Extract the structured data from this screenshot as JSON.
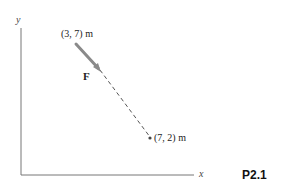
{
  "diagram": {
    "axes": {
      "x_label": "x",
      "y_label": "y"
    },
    "points": [
      {
        "name": "start",
        "label": "(3, 7) m"
      },
      {
        "name": "end",
        "label": "(7, 2) m"
      }
    ],
    "force_label": "F",
    "problem_number": "P2.1",
    "colors": {
      "arrow": "#8a8a8a",
      "axes": "#777777",
      "dash": "#555555"
    }
  }
}
